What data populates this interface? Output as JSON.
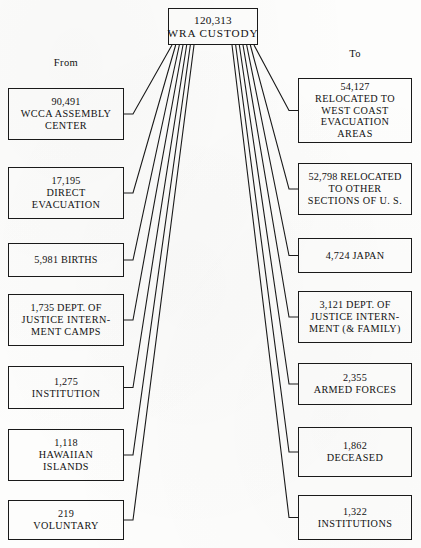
{
  "diagram": {
    "root": {
      "amount": "120,313",
      "label": "WRA CUSTODY",
      "box": {
        "x": 168,
        "y": 8,
        "w": 90,
        "h": 37
      }
    },
    "headings": {
      "from": "From",
      "to": "To"
    },
    "from_heading_pos": {
      "x": 8,
      "y": 57,
      "w": 116
    },
    "to_heading_pos": {
      "x": 298,
      "y": 48,
      "w": 114
    },
    "sources": [
      {
        "amount": "90,491",
        "lines": [
          "WCCA  ASSEMBLY",
          "CENTER"
        ],
        "box": {
          "x": 8,
          "y": 88,
          "w": 116,
          "h": 52
        }
      },
      {
        "amount": "17,195",
        "lines": [
          "DIRECT",
          "EVACUATION"
        ],
        "box": {
          "x": 8,
          "y": 167,
          "w": 116,
          "h": 52
        }
      },
      {
        "amount": "5,981  BIRTHS",
        "lines": [],
        "box": {
          "x": 8,
          "y": 243,
          "w": 116,
          "h": 34
        }
      },
      {
        "amount": "1,735  DEPT.  OF",
        "lines": [
          "JUSTICE  INTERN-",
          "MENT  CAMPS"
        ],
        "box": {
          "x": 8,
          "y": 294,
          "w": 116,
          "h": 52
        }
      },
      {
        "amount": "1,275",
        "lines": [
          "INSTITUTION"
        ],
        "box": {
          "x": 8,
          "y": 366,
          "w": 116,
          "h": 43
        }
      },
      {
        "amount": "1,118",
        "lines": [
          "HAWAIIAN",
          "ISLANDS"
        ],
        "box": {
          "x": 8,
          "y": 429,
          "w": 116,
          "h": 52
        }
      },
      {
        "amount": "219",
        "lines": [
          "VOLUNTARY"
        ],
        "box": {
          "x": 8,
          "y": 500,
          "w": 116,
          "h": 40
        }
      }
    ],
    "destinations": [
      {
        "amount": "54,127",
        "lines": [
          "RELOCATED  TO",
          "WEST  COAST",
          "EVACUATION",
          "AREAS"
        ],
        "box": {
          "x": 298,
          "y": 78,
          "w": 114,
          "h": 65
        }
      },
      {
        "amount": "52,798  RELOCATED",
        "lines": [
          "TO  OTHER",
          "SECTIONS  OF  U. S."
        ],
        "box": {
          "x": 298,
          "y": 163,
          "w": 114,
          "h": 52
        }
      },
      {
        "amount": "4,724  JAPAN",
        "lines": [],
        "box": {
          "x": 298,
          "y": 238,
          "w": 114,
          "h": 35
        }
      },
      {
        "amount": "3,121  DEPT.  OF",
        "lines": [
          "JUSTICE  INTERN-",
          "MENT  (& FAMILY)"
        ],
        "box": {
          "x": 298,
          "y": 291,
          "w": 114,
          "h": 52
        }
      },
      {
        "amount": "2,355",
        "lines": [
          "ARMED  FORCES"
        ],
        "box": {
          "x": 298,
          "y": 363,
          "w": 114,
          "h": 42
        }
      },
      {
        "amount": "1,862",
        "lines": [
          "DECEASED"
        ],
        "box": {
          "x": 298,
          "y": 427,
          "w": 114,
          "h": 50
        }
      },
      {
        "amount": "1,322",
        "lines": [
          "INSTITUTIONS"
        ],
        "box": {
          "x": 298,
          "y": 495,
          "w": 114,
          "h": 45
        }
      }
    ],
    "style": {
      "stroke": "#1a1a1a",
      "background": "#fdfdfc",
      "stroke_width": 1.1
    }
  },
  "chart_data": {
    "type": "diagram",
    "total": 120313,
    "inflow_label": "From",
    "outflow_label": "To",
    "inflows": [
      {
        "label": "WCCA ASSEMBLY CENTER",
        "value": 90491
      },
      {
        "label": "DIRECT EVACUATION",
        "value": 17195
      },
      {
        "label": "BIRTHS",
        "value": 5981
      },
      {
        "label": "DEPT. OF JUSTICE INTERNMENT CAMPS",
        "value": 1735
      },
      {
        "label": "INSTITUTION",
        "value": 1275
      },
      {
        "label": "HAWAIIAN ISLANDS",
        "value": 1118
      },
      {
        "label": "VOLUNTARY",
        "value": 219
      }
    ],
    "outflows": [
      {
        "label": "RELOCATED TO WEST COAST EVACUATION AREAS",
        "value": 54127
      },
      {
        "label": "RELOCATED TO OTHER SECTIONS OF U.S.",
        "value": 52798
      },
      {
        "label": "JAPAN",
        "value": 4724
      },
      {
        "label": "DEPT. OF JUSTICE INTERNMENT (& FAMILY)",
        "value": 3121
      },
      {
        "label": "ARMED FORCES",
        "value": 2355
      },
      {
        "label": "DECEASED",
        "value": 1862
      },
      {
        "label": "INSTITUTIONS",
        "value": 1322
      }
    ]
  }
}
